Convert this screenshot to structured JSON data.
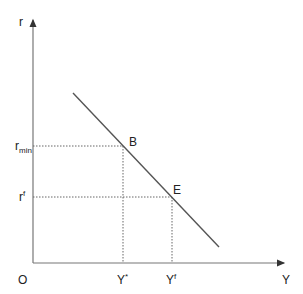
{
  "diagram": {
    "axes": {
      "y_label": "r",
      "x_label": "Y",
      "origin_label": "O"
    },
    "curve": {
      "start": [
        73,
        93
      ],
      "end": [
        219,
        247
      ],
      "color": "#555555"
    },
    "points": [
      {
        "label": "B",
        "x": 123,
        "y": 146
      },
      {
        "label": "E",
        "x": 172,
        "y": 197
      }
    ],
    "y_ticks": [
      {
        "base": "r",
        "sub": "min",
        "sup": ""
      },
      {
        "base": "r",
        "sub": "",
        "sup": "f"
      }
    ],
    "x_ticks": [
      {
        "base": "Y",
        "sup": "*"
      },
      {
        "base": "Y",
        "sup": "f"
      }
    ]
  }
}
